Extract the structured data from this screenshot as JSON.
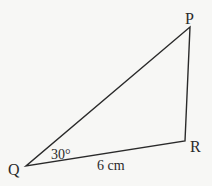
{
  "diagram": {
    "type": "triangle",
    "vertices": {
      "P": {
        "label": "P",
        "x": 190,
        "y": 27
      },
      "Q": {
        "label": "Q",
        "x": 26,
        "y": 166
      },
      "R": {
        "label": "R",
        "x": 185,
        "y": 141
      }
    },
    "angle_label": "30°",
    "side_label": "6 cm",
    "colors": {
      "line": "#2a2a2a",
      "background": "#f7f7f5"
    }
  }
}
